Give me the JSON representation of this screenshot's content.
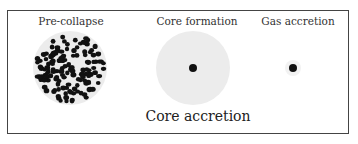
{
  "diagram": {
    "panels": [
      {
        "label": "Pre-collapse",
        "stage": "pre-collapse"
      },
      {
        "label": "Core formation",
        "stage": "core-formation"
      },
      {
        "label": "Gas accretion",
        "stage": "gas-accretion"
      }
    ],
    "caption": "Core accretion"
  },
  "colors": {
    "frame": "#444444",
    "cloud": "#ececec",
    "particle": "#111111",
    "text": "#333333"
  }
}
